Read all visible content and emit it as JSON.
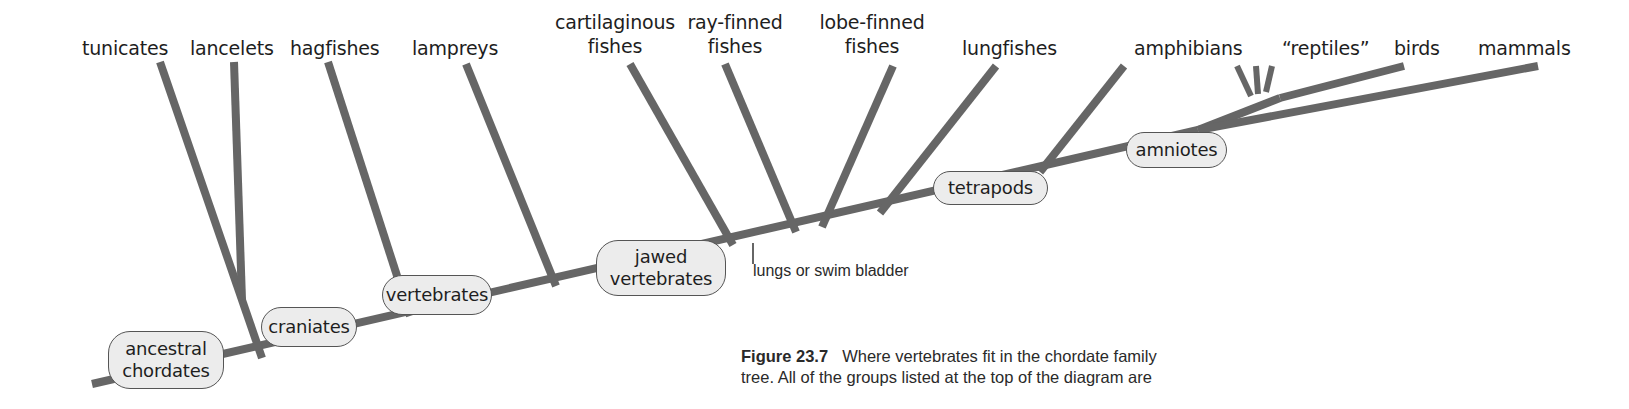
{
  "diagram": {
    "type": "cladogram",
    "title": "Chordate family tree",
    "branch_color": "#666666",
    "node_fill": "#ececec",
    "taxa": [
      {
        "id": "tunicates",
        "line1": "tunicates",
        "line2": ""
      },
      {
        "id": "lancelets",
        "line1": "lancelets",
        "line2": ""
      },
      {
        "id": "hagfishes",
        "line1": "hagfishes",
        "line2": ""
      },
      {
        "id": "lampreys",
        "line1": "lampreys",
        "line2": ""
      },
      {
        "id": "cartilaginous-fishes",
        "line1": "cartilaginous",
        "line2": "fishes"
      },
      {
        "id": "ray-finned-fishes",
        "line1": "ray-finned",
        "line2": "fishes"
      },
      {
        "id": "lobe-finned-fishes",
        "line1": "lobe-finned",
        "line2": "fishes"
      },
      {
        "id": "lungfishes",
        "line1": "lungfishes",
        "line2": ""
      },
      {
        "id": "amphibians",
        "line1": "amphibians",
        "line2": ""
      },
      {
        "id": "reptiles",
        "line1": "“reptiles”",
        "line2": ""
      },
      {
        "id": "birds",
        "line1": "birds",
        "line2": ""
      },
      {
        "id": "mammals",
        "line1": "mammals",
        "line2": ""
      }
    ],
    "nodes": [
      {
        "id": "ancestral-chordates",
        "line1": "ancestral",
        "line2": "chordates"
      },
      {
        "id": "craniates",
        "line1": "craniates",
        "line2": ""
      },
      {
        "id": "vertebrates",
        "line1": "vertebrates",
        "line2": ""
      },
      {
        "id": "jawed-vertebrates",
        "line1": "jawed",
        "line2": "vertebrates"
      },
      {
        "id": "tetrapods",
        "line1": "tetrapods",
        "line2": ""
      },
      {
        "id": "amniotes",
        "line1": "amniotes",
        "line2": ""
      }
    ],
    "annotations": [
      {
        "id": "lungs-swim-bladder",
        "text": "lungs or swim bladder"
      }
    ]
  },
  "caption": {
    "label": "Figure 23.7",
    "line1": "Where vertebrates fit in the chordate family",
    "line2": "tree. All of the groups listed at the top of the diagram are"
  }
}
